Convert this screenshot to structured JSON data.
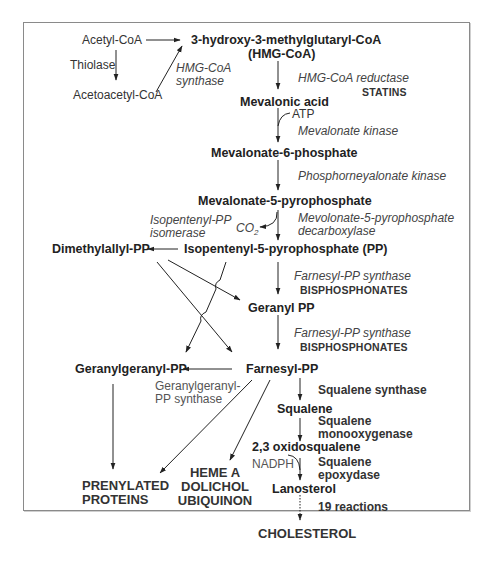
{
  "diagram": {
    "frame_color": "#8a8a8a",
    "line_color": "#222222",
    "metabolites": {
      "acetyl_coa": "Acetyl-CoA",
      "acetoacetyl_coa": "Acetoacetyl-CoA",
      "hmg_coa_line1": "3-hydroxy-3-methylglutaryl-CoA",
      "hmg_coa_line2": "(HMG-CoA)",
      "mevalonic_acid": "Mevalonic acid",
      "mevalonate_6p": "Mevalonate-6-phosphate",
      "mevalonate_5pp": "Mevalonate-5-pyrophosphate",
      "isopentenyl_pp": "Isopentenyl-5-pyrophosphate (PP)",
      "dimethylallyl_pp": "Dimethylallyl-PP",
      "geranyl_pp": "Geranyl PP",
      "farnesyl_pp": "Farnesyl-PP",
      "geranylgeranyl_pp": "Geranylgeranyl-PP",
      "squalene": "Squalene",
      "oxidosqualene": "2,3 oxidosqualene",
      "lanosterol": "Lanosterol",
      "cholesterol": "CHOLESTEROL"
    },
    "end_products": {
      "prenylated_line1": "PRENYLATED",
      "prenylated_line2": "PROTEINS",
      "heme_a": "HEME A",
      "dolichol": "DOLICHOL",
      "ubiquinon": "UBIQUINON"
    },
    "enzymes": {
      "thiolase": "Thiolase",
      "hmg_synthase_line1": "HMG-CoA",
      "hmg_synthase_line2": "synthase",
      "hmg_reductase": "HMG-CoA reductase",
      "mevalonate_kinase": "Mevalonate kinase",
      "phosphomevalonate_kinase": "Phosphorneyalonate kinase",
      "decarboxylase_line1": "Mevolonate-5-pyrophosphate",
      "decarboxylase_line2": "decarboxylase",
      "isomerase_line1": "Isopentenyl-PP",
      "isomerase_line2": "isomerase",
      "fpp_synthase_1": "Farnesyl-PP synthase",
      "fpp_synthase_2": "Farnesyl-PP synthase",
      "ggpp_synthase_line1": "Geranylgeranyl-",
      "ggpp_synthase_line2": "PP synthase",
      "squalene_synthase": "Squalene synthase",
      "squalene_monoox_line1": "Squalene",
      "squalene_monoox_line2": "monooxygenase",
      "squalene_epox_line1": "Squalene",
      "squalene_epox_line2": "epoxydase",
      "nineteen_reactions": "19 reactions"
    },
    "inhibitors": {
      "statins": "STATINS",
      "bisphosphonates_1": "BISPHOSPHONATES",
      "bisphosphonates_2": "BISPHOSPHONATES"
    },
    "cofactors": {
      "atp": "ATP",
      "co2": "CO",
      "co2_sub": "2",
      "nadph": "NADPH"
    }
  }
}
